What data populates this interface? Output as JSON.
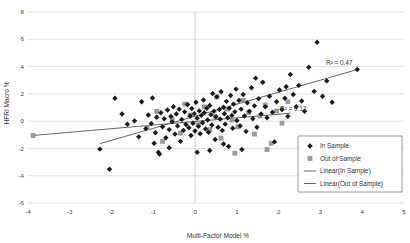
{
  "chart_data": {
    "type": "scatter",
    "title": "",
    "xlabel": "Multi-Factor Model %",
    "ylabel": "HFRI Macro %",
    "xlim": [
      -4,
      5
    ],
    "ylim": [
      -6,
      8
    ],
    "xticks": [
      -4,
      -3,
      -2,
      -1,
      0,
      1,
      2,
      3,
      4,
      5
    ],
    "yticks": [
      -6,
      -4,
      -2,
      0,
      2,
      4,
      6,
      8
    ],
    "grid": true,
    "legend_position": "bottom-right",
    "annotations": [
      {
        "text": "R² = 0.47",
        "x": 3.45,
        "y": 4.15
      },
      {
        "text": "R² = 0.12",
        "x": 2.35,
        "y": 0.75
      }
    ],
    "series": [
      {
        "name": "In Sample",
        "marker": "diamond",
        "color": "#1a1a1a",
        "points": [
          [
            -2.28,
            -2.05
          ],
          [
            -1.92,
            1.68
          ],
          [
            -1.62,
            -0.22
          ],
          [
            -1.45,
            0.02
          ],
          [
            -1.35,
            -1.15
          ],
          [
            -1.28,
            1.42
          ],
          [
            -1.18,
            -0.55
          ],
          [
            -1.12,
            0.45
          ],
          [
            -1.05,
            -0.18
          ],
          [
            -1.02,
            1.7
          ],
          [
            -0.98,
            -1.62
          ],
          [
            -0.95,
            -0.85
          ],
          [
            -0.92,
            0.28
          ],
          [
            -0.88,
            -2.28
          ],
          [
            -0.85,
            -2.42
          ],
          [
            -0.82,
            0.62
          ],
          [
            -0.78,
            -0.42
          ],
          [
            -0.74,
            0.18
          ],
          [
            -0.7,
            -1.22
          ],
          [
            -0.66,
            0.82
          ],
          [
            -0.62,
            -0.62
          ],
          [
            -0.58,
            0.35
          ],
          [
            -0.55,
            -0.05
          ],
          [
            -0.52,
            1.05
          ],
          [
            -0.48,
            -0.95
          ],
          [
            -0.45,
            0.52
          ],
          [
            -0.42,
            -0.35
          ],
          [
            -0.38,
            0.88
          ],
          [
            -0.35,
            -1.48
          ],
          [
            -0.32,
            0.12
          ],
          [
            -0.28,
            -0.68
          ],
          [
            -0.25,
            0.68
          ],
          [
            -0.22,
            -0.25
          ],
          [
            -0.18,
            1.22
          ],
          [
            -0.15,
            -0.48
          ],
          [
            -0.12,
            0.38
          ],
          [
            -0.1,
            -1.05
          ],
          [
            -0.08,
            0.92
          ],
          [
            -0.05,
            -0.15
          ],
          [
            -0.02,
            0.55
          ],
          [
            0.0,
            -0.72
          ],
          [
            0.02,
            1.38
          ],
          [
            0.05,
            0.22
          ],
          [
            0.08,
            -0.38
          ],
          [
            0.1,
            0.75
          ],
          [
            0.12,
            -0.92
          ],
          [
            0.15,
            0.42
          ],
          [
            0.18,
            -0.12
          ],
          [
            0.2,
            1.55
          ],
          [
            0.22,
            0.62
          ],
          [
            0.25,
            -0.58
          ],
          [
            0.28,
            0.95
          ],
          [
            0.3,
            0.08
          ],
          [
            0.32,
            -0.82
          ],
          [
            0.35,
            1.15
          ],
          [
            0.38,
            0.48
          ],
          [
            0.4,
            -0.28
          ],
          [
            0.42,
            2.02
          ],
          [
            0.45,
            0.72
          ],
          [
            0.48,
            -1.35
          ],
          [
            0.5,
            0.32
          ],
          [
            0.52,
            1.78
          ],
          [
            0.55,
            -0.45
          ],
          [
            0.58,
            0.85
          ],
          [
            0.6,
            0.15
          ],
          [
            0.62,
            2.15
          ],
          [
            0.65,
            -0.68
          ],
          [
            0.68,
            1.02
          ],
          [
            0.7,
            0.55
          ],
          [
            0.72,
            -0.22
          ],
          [
            0.75,
            1.45
          ],
          [
            0.78,
            0.25
          ],
          [
            0.8,
            -1.85
          ],
          [
            0.82,
            0.95
          ],
          [
            0.85,
            1.88
          ],
          [
            0.88,
            0.42
          ],
          [
            0.9,
            -0.52
          ],
          [
            0.92,
            1.25
          ],
          [
            0.95,
            0.68
          ],
          [
            0.98,
            2.35
          ],
          [
            1.0,
            0.05
          ],
          [
            1.05,
            1.52
          ],
          [
            1.08,
            -0.35
          ],
          [
            1.1,
            0.88
          ],
          [
            1.15,
            1.95
          ],
          [
            1.18,
            0.38
          ],
          [
            1.22,
            -0.75
          ],
          [
            1.25,
            1.35
          ],
          [
            1.3,
            0.72
          ],
          [
            1.35,
            2.45
          ],
          [
            1.38,
            0.18
          ],
          [
            1.42,
            1.12
          ],
          [
            1.48,
            -0.45
          ],
          [
            1.52,
            1.65
          ],
          [
            1.58,
            0.52
          ],
          [
            1.62,
            2.85
          ],
          [
            1.68,
            1.05
          ],
          [
            1.72,
            0.25
          ],
          [
            1.78,
            1.82
          ],
          [
            1.85,
            0.65
          ],
          [
            1.9,
            -1.52
          ],
          [
            1.95,
            1.42
          ],
          [
            2.02,
            2.28
          ],
          [
            2.08,
            0.85
          ],
          [
            2.15,
            1.68
          ],
          [
            2.22,
            0.35
          ],
          [
            2.28,
            3.42
          ],
          [
            2.35,
            1.95
          ],
          [
            2.42,
            1.05
          ],
          [
            2.48,
            2.62
          ],
          [
            2.55,
            1.48
          ],
          [
            2.62,
            0.72
          ],
          [
            2.72,
            3.95
          ],
          [
            2.85,
            2.18
          ],
          [
            2.92,
            5.78
          ],
          [
            3.05,
            1.82
          ],
          [
            3.15,
            2.95
          ],
          [
            3.28,
            1.38
          ],
          [
            3.88,
            3.78
          ],
          [
            -2.05,
            -3.52
          ],
          [
            0.05,
            -2.28
          ],
          [
            0.35,
            -2.15
          ],
          [
            1.12,
            -2.08
          ],
          [
            -0.62,
            -1.95
          ],
          [
            0.68,
            -1.68
          ],
          [
            1.45,
            3.15
          ],
          [
            2.18,
            2.52
          ],
          [
            -1.75,
            0.52
          ]
        ]
      },
      {
        "name": "Out of Sample",
        "marker": "square",
        "color": "#9a9a9a",
        "points": [
          [
            -3.88,
            -1.05
          ],
          [
            -1.15,
            -0.48
          ],
          [
            -0.92,
            0.72
          ],
          [
            -0.78,
            -1.48
          ],
          [
            -0.55,
            0.15
          ],
          [
            -0.35,
            -0.88
          ],
          [
            -0.12,
            0.45
          ],
          [
            0.08,
            -0.25
          ],
          [
            0.22,
            1.05
          ],
          [
            0.35,
            -0.62
          ],
          [
            0.48,
            0.32
          ],
          [
            0.62,
            -1.25
          ],
          [
            0.75,
            0.88
          ],
          [
            0.88,
            0.08
          ],
          [
            1.02,
            -0.42
          ],
          [
            1.15,
            1.52
          ],
          [
            1.28,
            0.62
          ],
          [
            1.42,
            -0.95
          ],
          [
            1.55,
            0.38
          ],
          [
            1.68,
            1.18
          ],
          [
            1.82,
            -1.62
          ],
          [
            1.95,
            0.75
          ],
          [
            2.08,
            -0.15
          ],
          [
            2.22,
            1.42
          ],
          [
            1.72,
            -2.08
          ],
          [
            0.95,
            -2.35
          ],
          [
            0.52,
            1.78
          ],
          [
            -0.25,
            1.25
          ]
        ]
      }
    ],
    "trendlines": [
      {
        "name": "Linear(In Sample)",
        "color": "#555555",
        "x0": -2.28,
        "y0": -1.65,
        "x1": 3.88,
        "y1": 3.78
      },
      {
        "name": "Linear(Out of Sample)",
        "color": "#555555",
        "x0": -3.88,
        "y0": -1.05,
        "x1": 2.28,
        "y1": 0.58
      }
    ],
    "legend": [
      {
        "label": "In Sample",
        "marker": "diamond",
        "color": "#1a1a1a"
      },
      {
        "label": "Out of Sample",
        "marker": "square",
        "color": "#9a9a9a"
      },
      {
        "label": "Linear(In Sample)",
        "marker": "line",
        "color": "#555555"
      },
      {
        "label": "Linear(Out of Sample)",
        "marker": "line",
        "color": "#555555"
      }
    ]
  }
}
